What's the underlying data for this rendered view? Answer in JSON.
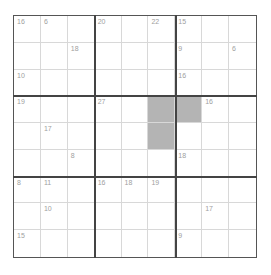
{
  "puzzle": {
    "type": "killer-sudoku",
    "size": 9,
    "shaded_cells": [
      [
        3,
        5
      ],
      [
        3,
        6
      ],
      [
        4,
        5
      ]
    ],
    "cage_sums": [
      {
        "row": 0,
        "col": 0,
        "sum": "16"
      },
      {
        "row": 0,
        "col": 1,
        "sum": "6"
      },
      {
        "row": 0,
        "col": 3,
        "sum": "20"
      },
      {
        "row": 0,
        "col": 5,
        "sum": "22"
      },
      {
        "row": 0,
        "col": 6,
        "sum": "15"
      },
      {
        "row": 1,
        "col": 2,
        "sum": "18"
      },
      {
        "row": 1,
        "col": 6,
        "sum": "9"
      },
      {
        "row": 1,
        "col": 8,
        "sum": "6"
      },
      {
        "row": 2,
        "col": 0,
        "sum": "10"
      },
      {
        "row": 2,
        "col": 6,
        "sum": "16"
      },
      {
        "row": 3,
        "col": 0,
        "sum": "19"
      },
      {
        "row": 3,
        "col": 3,
        "sum": "27"
      },
      {
        "row": 3,
        "col": 7,
        "sum": "16"
      },
      {
        "row": 4,
        "col": 1,
        "sum": "17"
      },
      {
        "row": 5,
        "col": 2,
        "sum": "8"
      },
      {
        "row": 5,
        "col": 6,
        "sum": "18"
      },
      {
        "row": 6,
        "col": 0,
        "sum": "8"
      },
      {
        "row": 6,
        "col": 1,
        "sum": "11"
      },
      {
        "row": 6,
        "col": 3,
        "sum": "16"
      },
      {
        "row": 6,
        "col": 4,
        "sum": "18"
      },
      {
        "row": 6,
        "col": 5,
        "sum": "19"
      },
      {
        "row": 7,
        "col": 1,
        "sum": "10"
      },
      {
        "row": 7,
        "col": 7,
        "sum": "17"
      },
      {
        "row": 8,
        "col": 0,
        "sum": "15"
      },
      {
        "row": 8,
        "col": 6,
        "sum": "9"
      }
    ],
    "colors": {
      "shaded": "#b4b4b4",
      "box_line": "#444444",
      "cell_line": "#d8d8d8",
      "cage_sum_text": "#a0a0a0"
    }
  }
}
